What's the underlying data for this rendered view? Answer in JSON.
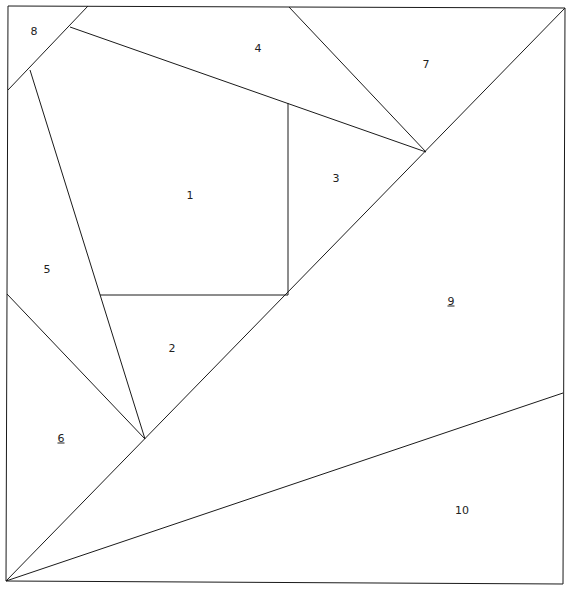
{
  "diagram": {
    "title": "",
    "stroke_color": "#1a1a1a",
    "background": "#ffffff",
    "frame": [
      [
        8,
        6
      ],
      [
        565,
        8
      ],
      [
        563,
        584
      ],
      [
        6,
        581
      ]
    ],
    "segments": [
      [
        [
          88,
          6
        ],
        [
          8,
          90
        ]
      ],
      [
        [
          70,
          27
        ],
        [
          426,
          152
        ]
      ],
      [
        [
          289,
          7
        ],
        [
          426,
          152
        ]
      ],
      [
        [
          565,
          8
        ],
        [
          6,
          581
        ]
      ],
      [
        [
          30,
          70
        ],
        [
          145,
          439
        ]
      ],
      [
        [
          7,
          294
        ],
        [
          145,
          439
        ]
      ],
      [
        [
          100,
          295
        ],
        [
          288,
          295
        ]
      ],
      [
        [
          288,
          103
        ],
        [
          288,
          295
        ]
      ],
      [
        [
          6,
          581
        ],
        [
          563,
          393
        ]
      ]
    ],
    "regions": [
      {
        "id": "1",
        "label": "1",
        "underlined": false,
        "x": 190,
        "y": 195
      },
      {
        "id": "2",
        "label": "2",
        "underlined": false,
        "x": 172,
        "y": 348
      },
      {
        "id": "3",
        "label": "3",
        "underlined": false,
        "x": 336,
        "y": 178
      },
      {
        "id": "4",
        "label": "4",
        "underlined": false,
        "x": 258,
        "y": 48
      },
      {
        "id": "5",
        "label": "5",
        "underlined": false,
        "x": 47,
        "y": 269
      },
      {
        "id": "6",
        "label": "6",
        "underlined": true,
        "x": 61,
        "y": 438
      },
      {
        "id": "7",
        "label": "7",
        "underlined": false,
        "x": 426,
        "y": 64
      },
      {
        "id": "8",
        "label": "8",
        "underlined": false,
        "x": 34,
        "y": 31
      },
      {
        "id": "9",
        "label": "9",
        "underlined": true,
        "x": 451,
        "y": 301
      },
      {
        "id": "10",
        "label": "10",
        "underlined": false,
        "x": 462,
        "y": 510
      }
    ]
  }
}
